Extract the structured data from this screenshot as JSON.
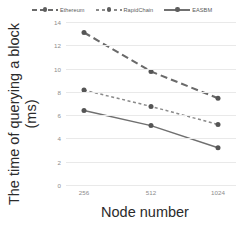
{
  "chart_data": {
    "type": "line",
    "title": "",
    "subtitle": "",
    "xlabel": "Node number",
    "ylabel": "The time of querying a block (ms)",
    "ylabel_lines": [
      "The time of querying a block",
      "(ms)"
    ],
    "categories": [
      "256",
      "512",
      "1024"
    ],
    "x": [
      256,
      512,
      1024
    ],
    "ylim": [
      0,
      14
    ],
    "yticks": [
      0,
      2,
      4,
      6,
      8,
      10,
      12,
      14
    ],
    "ytick_labels": [
      "0",
      "2",
      "4",
      "6",
      "8",
      "10",
      "12",
      "14"
    ],
    "grid": true,
    "grid_axis": "y",
    "legend_position": "top",
    "series": [
      {
        "name": "Ethereum",
        "values": [
          13.1,
          9.75,
          7.45
        ],
        "line_style": "long-dash",
        "color": "#6a6a6a",
        "marker": "circle"
      },
      {
        "name": "RapidChain",
        "values": [
          8.15,
          6.75,
          5.2
        ],
        "line_style": "dotted",
        "color": "#8a8a8a",
        "marker": "circle"
      },
      {
        "name": "EASBM",
        "values": [
          6.4,
          5.1,
          3.2
        ],
        "line_style": "solid",
        "color": "#707070",
        "marker": "circle"
      }
    ]
  },
  "legend": {
    "items": [
      {
        "label": "Ethereum",
        "style": "style-dash"
      },
      {
        "label": "RapidChain",
        "style": "style-dot"
      },
      {
        "label": "EASBM",
        "style": "style-solid"
      }
    ]
  },
  "colors": {
    "background": "#ffffff",
    "gridline": "#e9e9e9",
    "tick_text": "#8c8c8c",
    "axis_title": "#2b2b2b",
    "legend_text": "#5a5a5a"
  }
}
